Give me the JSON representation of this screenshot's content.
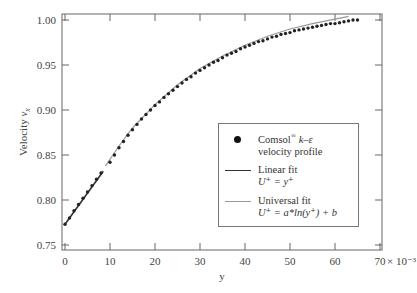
{
  "chart_data": {
    "type": "scatter",
    "title": "",
    "xlabel": "y",
    "ylabel": "Velocity v_x",
    "x_multiplier_label": "× 10⁻³",
    "xlim": [
      0,
      70
    ],
    "ylim": [
      0.75,
      1.0
    ],
    "x_ticks": [
      "0",
      "10",
      "20",
      "30",
      "40",
      "50",
      "60",
      "70"
    ],
    "y_ticks": [
      "0.75",
      "0.80",
      "0.85",
      "0.90",
      "0.95",
      "1.00"
    ],
    "grid": false,
    "legend_position": "lower-right-inside",
    "series": [
      {
        "name": "Comsol® k–ε velocity profile",
        "style": "markers",
        "color": "#222222",
        "x": [
          0,
          1,
          2,
          3,
          4,
          5,
          6,
          7,
          8,
          10,
          11,
          12,
          13,
          14,
          15,
          16,
          17,
          18,
          19,
          20,
          21,
          22,
          23,
          24,
          25,
          26,
          27,
          28,
          29,
          30,
          31,
          32,
          33,
          34,
          35,
          36,
          37,
          38,
          39,
          40,
          41,
          42,
          43,
          44,
          45,
          46,
          47,
          48,
          49,
          50,
          51,
          52,
          53,
          54,
          55,
          56,
          57,
          58,
          59,
          60,
          61,
          62,
          63,
          64,
          65
        ],
        "y": [
          0.773,
          0.78,
          0.788,
          0.795,
          0.802,
          0.809,
          0.816,
          0.823,
          0.83,
          0.842,
          0.85,
          0.858,
          0.865,
          0.872,
          0.878,
          0.884,
          0.89,
          0.895,
          0.9,
          0.905,
          0.909,
          0.914,
          0.918,
          0.922,
          0.926,
          0.93,
          0.934,
          0.937,
          0.941,
          0.944,
          0.947,
          0.95,
          0.953,
          0.955,
          0.958,
          0.961,
          0.963,
          0.965,
          0.968,
          0.97,
          0.972,
          0.974,
          0.976,
          0.977,
          0.979,
          0.981,
          0.982,
          0.984,
          0.985,
          0.986,
          0.988,
          0.989,
          0.99,
          0.991,
          0.992,
          0.993,
          0.994,
          0.995,
          0.996,
          0.996,
          0.997,
          0.998,
          0.999,
          1.0,
          1.0
        ]
      },
      {
        "name": "Linear fit U⁺ = y⁺",
        "style": "line",
        "color": "#333333",
        "x": [
          0,
          8.5
        ],
        "y": [
          0.773,
          0.832
        ]
      },
      {
        "name": "Universal fit U⁺ = a*ln(y⁺) + b",
        "style": "line",
        "color": "#999999",
        "x": [
          9,
          12,
          15,
          20,
          25,
          30,
          35,
          40,
          45,
          50,
          55,
          60,
          63
        ],
        "y": [
          0.838,
          0.86,
          0.88,
          0.906,
          0.928,
          0.946,
          0.96,
          0.972,
          0.982,
          0.99,
          0.996,
          1.001,
          1.004
        ]
      }
    ]
  },
  "legend": {
    "items": [
      {
        "line1": "Comsol",
        "sup": "®",
        "line1b": " k–ε",
        "line2": "velocity profile"
      },
      {
        "line1": "Linear fit",
        "line2": "U⁺ = y⁺"
      },
      {
        "line1": "Universal fit",
        "line2": "U⁺ = a*ln(y⁺) + b"
      }
    ]
  }
}
